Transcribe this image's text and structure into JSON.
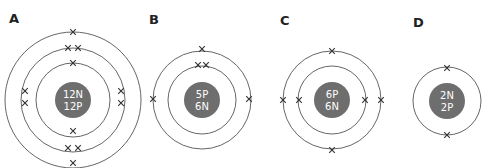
{
  "diagram": {
    "colors": {
      "nucleus": "#6e6e6e",
      "ring": "#555555",
      "electron": "#333333",
      "nucleus_text": "#ffffff"
    },
    "atoms": [
      {
        "label": "A",
        "nucleus_line1": "12N",
        "nucleus_line2": "12P",
        "shells": [
          2,
          8,
          2
        ],
        "center": [
          73,
          100
        ],
        "ring_radii": [
          37,
          52,
          68
        ],
        "electrons": [
          {
            "ring": 0,
            "pos": [
              73,
              63
            ]
          },
          {
            "ring": 0,
            "pos": [
              73,
              131
            ]
          },
          {
            "ring": 1,
            "pos": [
              68,
              48
            ]
          },
          {
            "ring": 1,
            "pos": [
              78,
              48
            ]
          },
          {
            "ring": 1,
            "pos": [
              25,
              91
            ]
          },
          {
            "ring": 1,
            "pos": [
              25,
              103
            ]
          },
          {
            "ring": 1,
            "pos": [
              121,
              91
            ]
          },
          {
            "ring": 1,
            "pos": [
              121,
              103
            ]
          },
          {
            "ring": 1,
            "pos": [
              68,
              148
            ]
          },
          {
            "ring": 1,
            "pos": [
              78,
              148
            ]
          },
          {
            "ring": 2,
            "pos": [
              73,
              32
            ]
          },
          {
            "ring": 2,
            "pos": [
              73,
              163
            ]
          }
        ]
      },
      {
        "label": "B",
        "nucleus_line1": "5P",
        "nucleus_line2": "6N",
        "shells": [
          2,
          3
        ],
        "center": [
          202,
          100
        ],
        "ring_radii": [
          34,
          49
        ],
        "electrons": [
          {
            "ring": 0,
            "pos": [
              198,
              65
            ]
          },
          {
            "ring": 0,
            "pos": [
              206,
              65
            ]
          },
          {
            "ring": 1,
            "pos": [
              202,
              49
            ]
          },
          {
            "ring": 1,
            "pos": [
              153,
              99
            ]
          },
          {
            "ring": 1,
            "pos": [
              249,
              99
            ]
          }
        ]
      },
      {
        "label": "C",
        "nucleus_line1": "6P",
        "nucleus_line2": "6N",
        "shells": [
          2,
          4
        ],
        "center": [
          332,
          100
        ],
        "ring_radii": [
          34,
          49
        ],
        "electrons": [
          {
            "ring": 0,
            "pos": [
              299,
              100
            ]
          },
          {
            "ring": 0,
            "pos": [
              365,
              100
            ]
          },
          {
            "ring": 1,
            "pos": [
              332,
              51
            ]
          },
          {
            "ring": 1,
            "pos": [
              283,
              100
            ]
          },
          {
            "ring": 1,
            "pos": [
              381,
              100
            ]
          },
          {
            "ring": 1,
            "pos": [
              332,
              150
            ]
          }
        ]
      },
      {
        "label": "D",
        "nucleus_line1": "2N",
        "nucleus_line2": "2P",
        "shells": [
          2
        ],
        "center": [
          447,
          101
        ],
        "ring_radii": [
          34
        ],
        "electrons": [
          {
            "ring": 0,
            "pos": [
              447,
              68
            ]
          },
          {
            "ring": 0,
            "pos": [
              447,
              135
            ]
          }
        ]
      }
    ]
  }
}
